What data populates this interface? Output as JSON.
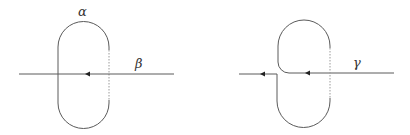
{
  "figure": {
    "left_panel": {
      "loop_label": "α",
      "path_label": "β"
    },
    "right_panel": {
      "path_label": "γ"
    }
  },
  "colors": {
    "stroke": "#5a5a5a",
    "dashed_stroke": "#9a9a9a",
    "arrow": "#222222",
    "label": "#333333"
  }
}
